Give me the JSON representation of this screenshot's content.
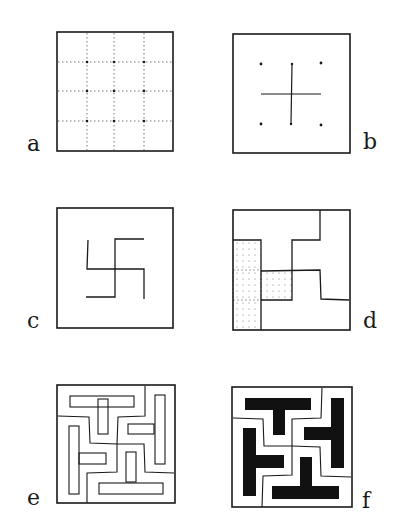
{
  "figure": {
    "panels": [
      {
        "id": "a",
        "label": "a",
        "description": "Square divided into 4x4 grid by dotted lines with dots at interior intersections"
      },
      {
        "id": "b",
        "label": "b",
        "description": "Square with a plus/cross and six dots"
      },
      {
        "id": "c",
        "label": "c",
        "description": "Square containing a swastika-like hooked cross line figure"
      },
      {
        "id": "d",
        "label": "d",
        "description": "Square divided into four interlocking rotated regions with one stippled cross region"
      },
      {
        "id": "e",
        "label": "e",
        "description": "Square containing four interlocking T-shaped outlined shapes in a maze-like arrangement"
      },
      {
        "id": "f",
        "label": "f",
        "description": "Square containing four interlocking solid black T-shapes within rotated cells"
      }
    ],
    "colors": {
      "ink": "#1a1a1a",
      "background": "#ffffff",
      "fill": "#111111"
    }
  }
}
